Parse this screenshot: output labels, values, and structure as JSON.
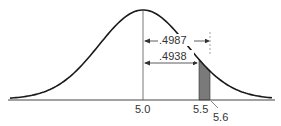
{
  "diagram": {
    "type": "normal-distribution",
    "mean": 5.0,
    "axis_labels": [
      "5.0",
      "5.5",
      "5.6"
    ],
    "areas": [
      {
        "label": ".4987",
        "from": 5.0,
        "to": 5.6
      },
      {
        "label": ".4938",
        "from": 5.0,
        "to": 5.5
      }
    ],
    "shaded_region": {
      "from": 5.5,
      "to": 5.6
    },
    "colors": {
      "curve": "#1a1a1a",
      "shade": "#7a7a7a",
      "axis": "#333333"
    }
  }
}
